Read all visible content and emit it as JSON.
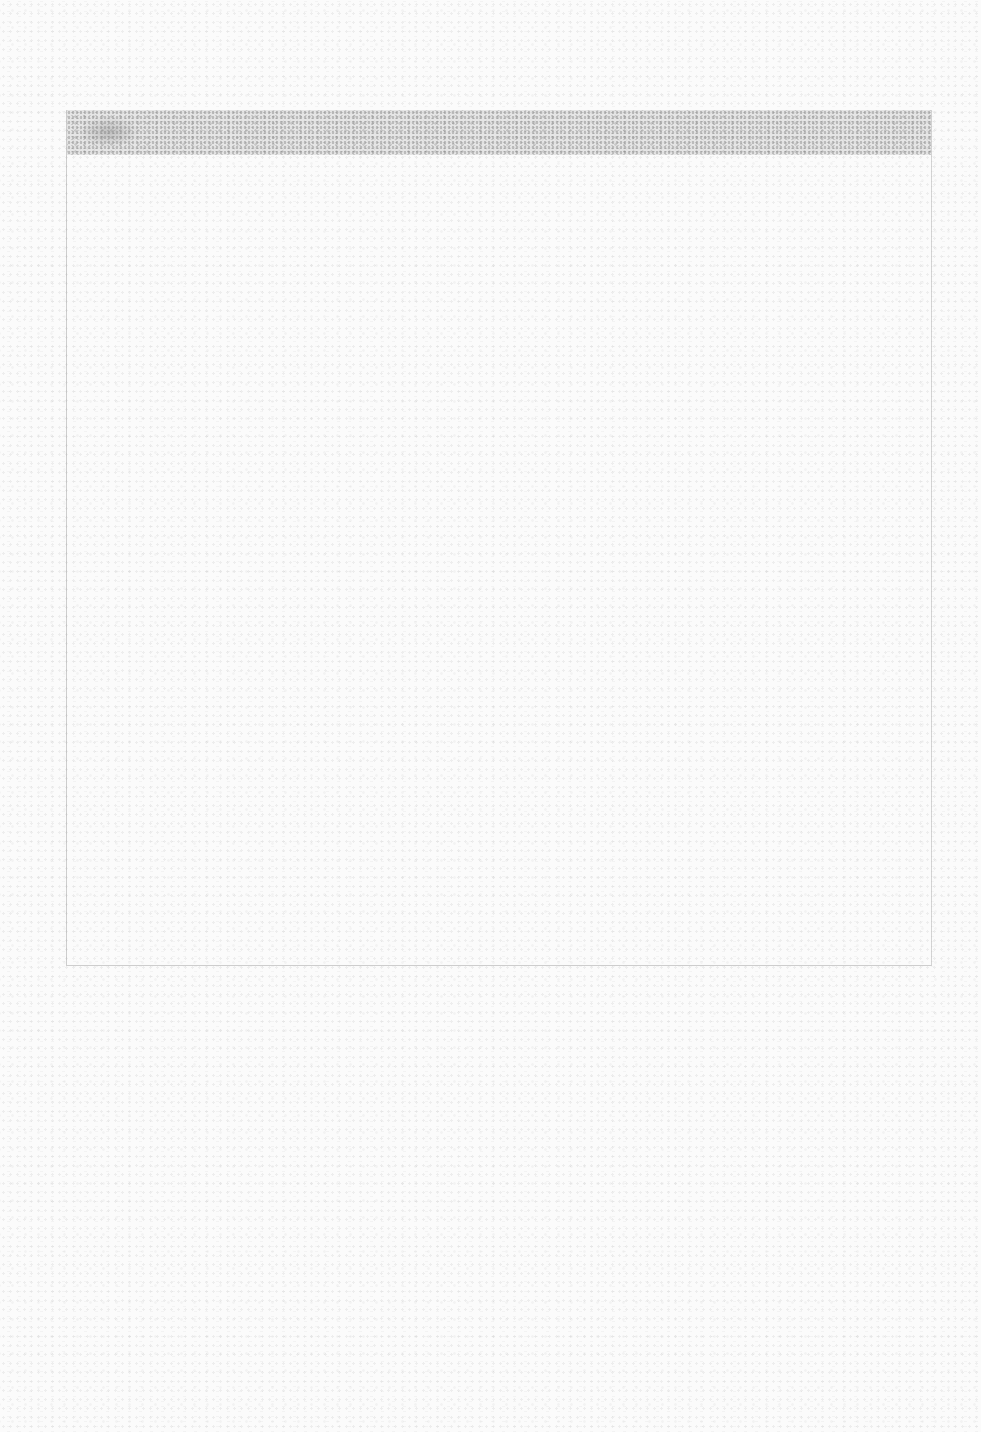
{
  "page": {
    "top_area_text": "",
    "colors": {
      "paper": "#fbfbfb",
      "header_band": "#bebebe",
      "border": "#969696"
    }
  },
  "form_box": {
    "header_text": "",
    "body_text": ""
  }
}
